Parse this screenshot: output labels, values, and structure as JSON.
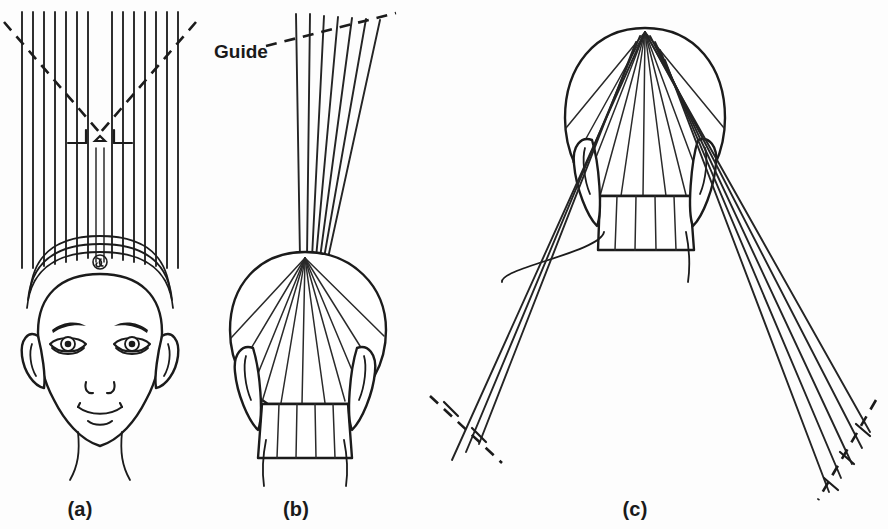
{
  "figure": {
    "background_color": "#fdfdfd",
    "ink_color": "#1b1b1b"
  },
  "labels": {
    "guide": "Guide",
    "panel_a": "(a)",
    "panel_b": "(b)",
    "panel_c": "(c)"
  },
  "panels": [
    {
      "id": "a",
      "caption": "(a)",
      "view": "front view of head with hair held straight up",
      "caption_x": 80,
      "caption_y": 512,
      "strand_groups": [
        {
          "name": "left-group",
          "count": 7,
          "x_start": 22,
          "x_end": 88,
          "y_top": 12,
          "y_bottom": 262
        },
        {
          "name": "right-group",
          "count": 7,
          "x_start": 112,
          "x_end": 178,
          "y_top": 12,
          "y_bottom": 262
        }
      ],
      "guide_marks": {
        "type": "v-shaped-dashed-guide",
        "apex_x": 100,
        "apex_y": 133,
        "left_end_x": 4,
        "left_end_y": 22,
        "right_end_x": 196,
        "right_end_y": 22,
        "tick_left_x": 72,
        "tick_right_x": 128,
        "tick_y": 143
      },
      "head": {
        "center_x": 100,
        "crown_swirl": true,
        "headband_bands": 3,
        "features": [
          "eyes",
          "eyebrows",
          "nose",
          "mouth",
          "ears",
          "neck"
        ]
      }
    },
    {
      "id": "b",
      "caption": "(b)",
      "view": "back view of head, hair gathered to crown point, held straight up",
      "caption_x": 296,
      "caption_y": 512,
      "strand_count": 7,
      "strand_x_start": 295,
      "strand_x_end": 380,
      "strand_y_top": 12,
      "strand_y_bottom": 258,
      "guide": {
        "label": "Guide",
        "label_x": 215,
        "label_y": 55,
        "dash_start_x": 265,
        "dash_start_y": 45,
        "dash_end_x": 395,
        "dash_end_y": 14
      },
      "apex": {
        "x": 305,
        "y": 258
      },
      "radiating_sections": 11,
      "nape_sections": 5
    },
    {
      "id": "c",
      "caption": "(c)",
      "view": "back view of head, hair distributed down and out to both sides",
      "caption_x": 635,
      "caption_y": 512,
      "apex": {
        "x": 645,
        "y": 32
      },
      "radiating_sections": 11,
      "nape_sections": 5,
      "left_fall": {
        "strand_count": 3,
        "cut_line": "dashed",
        "cut_x": 492,
        "cut_y": 410
      },
      "right_fall": {
        "strand_count": 5,
        "cut_line": "dashed",
        "cut_x": 838,
        "cut_y": 445
      }
    }
  ]
}
